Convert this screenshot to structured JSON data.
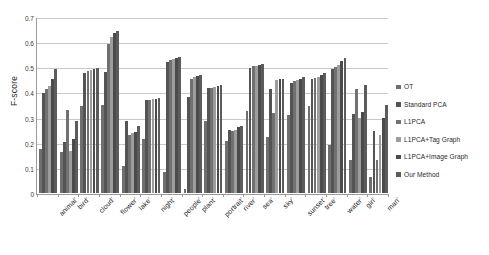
{
  "chart_data": {
    "type": "bar",
    "title": "",
    "subtitle": "",
    "xlabel": "",
    "ylabel": "F-score",
    "ylim": [
      0,
      0.7
    ],
    "ytick_labels": [
      "0",
      "0.1",
      "0.2",
      "0.3",
      "0.4",
      "0.5",
      "0.6",
      "0.7"
    ],
    "ytick_values": [
      0,
      0.1,
      0.2,
      0.3,
      0.4,
      0.5,
      0.6,
      0.7
    ],
    "grid": true,
    "legend_position": "right",
    "categories": [
      "animal'",
      "bird'",
      "cloud'",
      "flower'",
      "lake'",
      "night'",
      "people'",
      "plant'",
      "portrait'",
      "river'",
      "sea'",
      "sky'",
      "sunset'",
      "tree'",
      "water'",
      "girl'",
      "man'"
    ],
    "series": [
      {
        "name": "OT",
        "color": "#6f6f6f",
        "values": [
          0.175,
          0.165,
          0.345,
          0.35,
          0.108,
          0.213,
          0.085,
          0.015,
          0.288,
          0.206,
          0.326,
          0.222,
          0.31,
          0.345,
          0.192,
          0.131,
          0.062
        ]
      },
      {
        "name": "Standard PCA",
        "color": "#545454",
        "values": [
          0.398,
          0.202,
          0.476,
          0.48,
          0.285,
          0.371,
          0.522,
          0.383,
          0.416,
          0.252,
          0.497,
          0.412,
          0.439,
          0.452,
          0.495,
          0.316,
          0.248
        ]
      },
      {
        "name": "L1PCA",
        "color": "#717171",
        "values": [
          0.412,
          0.33,
          0.484,
          0.591,
          0.232,
          0.37,
          0.53,
          0.452,
          0.417,
          0.248,
          0.505,
          0.318,
          0.446,
          0.459,
          0.5,
          0.412,
          0.13
        ]
      },
      {
        "name": "L1PCA+Tag Graph",
        "color": "#9d9d9d",
        "values": [
          0.424,
          0.168,
          0.489,
          0.622,
          0.24,
          0.372,
          0.535,
          0.46,
          0.422,
          0.25,
          0.507,
          0.448,
          0.45,
          0.462,
          0.511,
          0.297,
          0.232
        ]
      },
      {
        "name": "L1PCA+Image Graph",
        "color": "#4b4b4b",
        "values": [
          0.452,
          0.216,
          0.492,
          0.636,
          0.244,
          0.374,
          0.538,
          0.465,
          0.425,
          0.262,
          0.51,
          0.452,
          0.455,
          0.47,
          0.524,
          0.322,
          0.3
        ]
      },
      {
        "name": "Our Method",
        "color": "#5c5c5c",
        "values": [
          0.492,
          0.288,
          0.498,
          0.644,
          0.265,
          0.376,
          0.54,
          0.47,
          0.43,
          0.268,
          0.512,
          0.455,
          0.46,
          0.476,
          0.538,
          0.43,
          0.35
        ]
      }
    ]
  },
  "legend": {
    "items": [
      {
        "label": "OT"
      },
      {
        "label": "Standard PCA"
      },
      {
        "label": "L1PCA"
      },
      {
        "label": "L1PCA+Tag Graph"
      },
      {
        "label": "L1PCA+Image Graph"
      },
      {
        "label": "Our Method"
      }
    ]
  }
}
